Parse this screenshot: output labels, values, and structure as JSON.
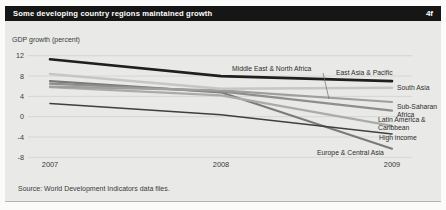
{
  "header": {
    "title": "Some developing country regions maintained growth",
    "figure_id": "4f",
    "bg_color": "#161616",
    "fg_color": "#ffffff"
  },
  "source": "Source: World Development Indicators data files.",
  "colors": {
    "panel_bg": "#e9e9e7",
    "gridline": "#d2d2d0",
    "tick_text": "#3a3a3a",
    "label_text": "#2e2e2e"
  },
  "chart_data": {
    "type": "line",
    "title": "Some developing country regions maintained growth",
    "ylabel": "GDP growth (percent)",
    "xlabel": "",
    "categories": [
      "2007",
      "2008",
      "2009"
    ],
    "ylim": [
      -8,
      12
    ],
    "yticks": [
      12,
      8,
      4,
      0,
      -4,
      -8
    ],
    "grid": true,
    "legend_position": "end-of-line labels",
    "series": [
      {
        "name": "East Asia & Pacific",
        "values": [
          11.3,
          8.0,
          7.0
        ],
        "color": "#1f1f1f",
        "width": 2.6,
        "label": {
          "x": 336,
          "y": 75,
          "anchor": "start",
          "lines": [
            "East Asia & Pacific"
          ]
        }
      },
      {
        "name": "South Asia",
        "values": [
          8.4,
          5.5,
          5.7
        ],
        "color": "#c6c6c4",
        "width": 2.4,
        "label": {
          "x": 397,
          "y": 90,
          "anchor": "start",
          "lines": [
            "South Asia"
          ]
        }
      },
      {
        "name": "Middle East & North Africa",
        "values": [
          5.9,
          5.2,
          2.9
        ],
        "color": "#9e9e9c",
        "width": 2.2,
        "label": {
          "x": 232,
          "y": 71,
          "anchor": "start",
          "lines": [
            "Middle East & North Africa"
          ]
        },
        "leader": {
          "x1": 323,
          "y1": 73,
          "x2": 329,
          "y2": 99
        }
      },
      {
        "name": "Sub-Saharan Africa",
        "values": [
          6.5,
          5.0,
          1.2
        ],
        "color": "#8e8e8c",
        "width": 2.2,
        "label": {
          "x": 397,
          "y": 109,
          "anchor": "start",
          "lines": [
            "Sub-Saharan",
            "Africa"
          ]
        }
      },
      {
        "name": "Latin America & Caribbean",
        "values": [
          5.8,
          4.2,
          -1.8
        ],
        "color": "#ababa9",
        "width": 2.2,
        "label": {
          "x": 378,
          "y": 122,
          "anchor": "start",
          "lines": [
            "Latin America &",
            "Caribbean"
          ]
        }
      },
      {
        "name": "High income",
        "values": [
          2.6,
          0.4,
          -3.4
        ],
        "color": "#3f3f3d",
        "width": 1.6,
        "label": {
          "x": 379,
          "y": 140,
          "anchor": "start",
          "lines": [
            "High income"
          ]
        }
      },
      {
        "name": "Europe & Central Asia",
        "values": [
          7.0,
          4.8,
          -6.3
        ],
        "color": "#7a7a78",
        "width": 2.2,
        "label": {
          "x": 317,
          "y": 155,
          "anchor": "start",
          "lines": [
            "Europe & Central Asia"
          ]
        }
      }
    ]
  }
}
